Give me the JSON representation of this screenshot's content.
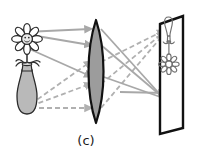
{
  "figure": {
    "kind": "optics-ray-diagram",
    "caption": "(c)",
    "background_color": "#ffffff",
    "panel_label": "(c)"
  },
  "object": {
    "name": "flower-in-vase",
    "label": "flower in vase",
    "orientation": "upright",
    "position": "left",
    "flower": {
      "petal_count": 8,
      "fill_color": "#ffffff",
      "outline_color": "#2b2b2b",
      "center_fill": "#e8e8e8",
      "has_face": true
    },
    "vase": {
      "fill_color": "#b9b9b9",
      "outline_color": "#2b2b2b"
    },
    "stem_color": "#3a3a3a"
  },
  "lens": {
    "name": "converging-lens",
    "label": "biconvex converging lens",
    "type": "biconvex",
    "fill_color": "#9c9c9c",
    "outline_color": "#111111",
    "outline_width": 2.2,
    "center_x": 96,
    "top_y": 20,
    "bottom_y": 123,
    "half_thickness": 14
  },
  "screen": {
    "name": "projection-screen",
    "label": "screen",
    "fill_color": "#ffffff",
    "frame_color": "#111111",
    "frame_width": 2.4,
    "image": {
      "label": "inverted real image",
      "orientation": "inverted",
      "vase_on_top": true,
      "flower_on_bottom": true,
      "outline_color": "#6f6f6f"
    }
  },
  "rays": {
    "solid": {
      "label": "rays from flower head",
      "color": "#a8a8a8",
      "style": "solid",
      "width": 1.8,
      "count": 3,
      "arrowheads": true
    },
    "dashed": {
      "label": "rays from base of vase",
      "color": "#b0b0b0",
      "style": "dashed",
      "width": 1.8,
      "dash_pattern": "5,3",
      "count": 3,
      "arrowheads": true
    }
  },
  "colors": {
    "ink": "#111111",
    "ray_gray": "#a8a8a8",
    "lens_gray": "#9c9c9c",
    "vase_gray": "#b9b9b9",
    "image_gray": "#6f6f6f"
  }
}
